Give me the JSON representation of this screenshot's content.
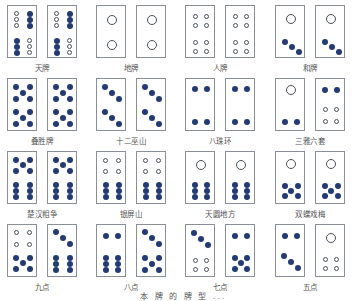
{
  "caption": "本 牌 的 牌 型 ...",
  "colors": {
    "pip_filled": "#243a73",
    "pip_outline": "#4a4f58",
    "border": "#8a8f96"
  },
  "groups": [
    {
      "label": "天牌",
      "x": 7,
      "y": 5,
      "tiles": [
        [
          [
            "o",
            6,
            5
          ],
          [
            "o",
            6,
            11
          ],
          [
            "o",
            6,
            17
          ],
          [
            "f",
            19,
            5
          ],
          [
            "f",
            19,
            11
          ],
          [
            "f",
            19,
            17
          ],
          [
            "f",
            6,
            32
          ],
          [
            "f",
            6,
            38
          ],
          [
            "f",
            6,
            44
          ],
          [
            "o",
            19,
            32
          ],
          [
            "o",
            19,
            38
          ],
          [
            "o",
            19,
            44
          ]
        ],
        [
          [
            "o",
            6,
            5
          ],
          [
            "o",
            6,
            11
          ],
          [
            "o",
            6,
            17
          ],
          [
            "f",
            19,
            5
          ],
          [
            "f",
            19,
            11
          ],
          [
            "f",
            19,
            17
          ],
          [
            "f",
            6,
            32
          ],
          [
            "f",
            6,
            38
          ],
          [
            "f",
            6,
            44
          ],
          [
            "o",
            19,
            32
          ],
          [
            "o",
            19,
            38
          ],
          [
            "o",
            19,
            44
          ]
        ]
      ]
    },
    {
      "label": "地牌",
      "x": 96,
      "y": 5,
      "tiles": [
        [
          [
            "big",
            10,
            9
          ],
          [
            "big",
            10,
            34
          ]
        ],
        [
          [
            "big",
            10,
            9
          ],
          [
            "big",
            10,
            34
          ]
        ]
      ]
    },
    {
      "label": "人牌",
      "x": 185,
      "y": 5,
      "tiles": [
        [
          [
            "o",
            7,
            8
          ],
          [
            "o",
            18,
            8
          ],
          [
            "o",
            7,
            17
          ],
          [
            "o",
            18,
            17
          ],
          [
            "o",
            7,
            34
          ],
          [
            "o",
            18,
            34
          ],
          [
            "o",
            7,
            43
          ],
          [
            "o",
            18,
            43
          ]
        ],
        [
          [
            "o",
            7,
            8
          ],
          [
            "o",
            18,
            8
          ],
          [
            "o",
            7,
            17
          ],
          [
            "o",
            18,
            17
          ],
          [
            "o",
            7,
            34
          ],
          [
            "o",
            18,
            34
          ],
          [
            "o",
            7,
            43
          ],
          [
            "o",
            18,
            43
          ]
        ]
      ]
    },
    {
      "label": "和牌",
      "x": 275,
      "y": 5,
      "tiles": [
        [
          [
            "big",
            10,
            8
          ],
          [
            "f",
            6,
            33
          ],
          [
            "f",
            13,
            38
          ],
          [
            "f",
            20,
            43
          ]
        ],
        [
          [
            "big",
            10,
            8
          ],
          [
            "f",
            6,
            33
          ],
          [
            "f",
            13,
            38
          ],
          [
            "f",
            20,
            43
          ]
        ]
      ]
    },
    {
      "label": "叠胜牌",
      "x": 7,
      "y": 78,
      "tiles": [
        [
          [
            "f",
            5,
            5
          ],
          [
            "f",
            19,
            5
          ],
          [
            "f",
            12,
            11
          ],
          [
            "f",
            5,
            17
          ],
          [
            "f",
            19,
            17
          ],
          [
            "f",
            5,
            30
          ],
          [
            "f",
            19,
            30
          ],
          [
            "f",
            12,
            36
          ],
          [
            "f",
            5,
            42
          ],
          [
            "f",
            19,
            42
          ]
        ],
        [
          [
            "f",
            5,
            5
          ],
          [
            "f",
            19,
            5
          ],
          [
            "f",
            12,
            11
          ],
          [
            "f",
            5,
            17
          ],
          [
            "f",
            19,
            17
          ],
          [
            "f",
            5,
            30
          ],
          [
            "f",
            19,
            30
          ],
          [
            "f",
            12,
            36
          ],
          [
            "f",
            5,
            42
          ],
          [
            "f",
            19,
            42
          ]
        ]
      ]
    },
    {
      "label": "十二巫山",
      "x": 96,
      "y": 78,
      "tiles": [
        [
          [
            "f",
            5,
            5
          ],
          [
            "f",
            12,
            11
          ],
          [
            "f",
            19,
            17
          ],
          [
            "f",
            5,
            30
          ],
          [
            "f",
            12,
            36
          ],
          [
            "f",
            19,
            42
          ]
        ],
        [
          [
            "f",
            5,
            5
          ],
          [
            "f",
            12,
            11
          ],
          [
            "f",
            19,
            17
          ],
          [
            "f",
            5,
            30
          ],
          [
            "f",
            12,
            36
          ],
          [
            "f",
            19,
            42
          ]
        ]
      ]
    },
    {
      "label": "八珠环",
      "x": 185,
      "y": 78,
      "tiles": [
        [
          [
            "f",
            6,
            7
          ],
          [
            "f",
            18,
            7
          ],
          [
            "f",
            6,
            40
          ],
          [
            "f",
            18,
            40
          ]
        ],
        [
          [
            "f",
            6,
            7
          ],
          [
            "f",
            18,
            7
          ],
          [
            "f",
            6,
            40
          ],
          [
            "f",
            18,
            40
          ]
        ]
      ]
    },
    {
      "label": "三雅六套",
      "x": 275,
      "y": 78,
      "tiles": [
        [
          [
            "big",
            10,
            6
          ],
          [
            "f",
            6,
            40
          ],
          [
            "f",
            18,
            40
          ]
        ],
        [
          [
            "f",
            6,
            8
          ],
          [
            "f",
            18,
            8
          ],
          [
            "o",
            7,
            28
          ],
          [
            "o",
            18,
            28
          ],
          [
            "o",
            7,
            40
          ],
          [
            "o",
            18,
            40
          ]
        ]
      ]
    },
    {
      "label": "楚汉相争",
      "x": 7,
      "y": 151,
      "tiles": [
        [
          [
            "f",
            5,
            5
          ],
          [
            "f",
            19,
            5
          ],
          [
            "f",
            12,
            10
          ],
          [
            "f",
            5,
            16
          ],
          [
            "f",
            19,
            16
          ],
          [
            "f",
            5,
            30
          ],
          [
            "f",
            19,
            30
          ],
          [
            "f",
            5,
            36
          ],
          [
            "f",
            19,
            36
          ],
          [
            "f",
            5,
            42
          ],
          [
            "f",
            19,
            42
          ]
        ],
        [
          [
            "f",
            5,
            5
          ],
          [
            "f",
            19,
            5
          ],
          [
            "f",
            12,
            10
          ],
          [
            "f",
            5,
            16
          ],
          [
            "f",
            19,
            16
          ],
          [
            "f",
            5,
            30
          ],
          [
            "f",
            19,
            30
          ],
          [
            "f",
            5,
            36
          ],
          [
            "f",
            19,
            36
          ],
          [
            "f",
            5,
            42
          ],
          [
            "f",
            19,
            42
          ]
        ]
      ]
    },
    {
      "label": "银屏山",
      "x": 96,
      "y": 151,
      "tiles": [
        [
          [
            "o",
            6,
            6
          ],
          [
            "o",
            19,
            6
          ],
          [
            "o",
            6,
            17
          ],
          [
            "o",
            19,
            17
          ],
          [
            "f",
            6,
            30
          ],
          [
            "f",
            19,
            30
          ],
          [
            "f",
            6,
            36
          ],
          [
            "f",
            19,
            36
          ],
          [
            "f",
            6,
            42
          ],
          [
            "f",
            19,
            42
          ]
        ],
        [
          [
            "o",
            6,
            6
          ],
          [
            "o",
            19,
            6
          ],
          [
            "o",
            6,
            17
          ],
          [
            "o",
            19,
            17
          ],
          [
            "f",
            6,
            30
          ],
          [
            "f",
            19,
            30
          ],
          [
            "f",
            6,
            36
          ],
          [
            "f",
            19,
            36
          ],
          [
            "f",
            6,
            42
          ],
          [
            "f",
            19,
            42
          ]
        ]
      ]
    },
    {
      "label": "天圆地方",
      "x": 185,
      "y": 151,
      "tiles": [
        [
          [
            "big",
            10,
            8
          ],
          [
            "f",
            6,
            30
          ],
          [
            "f",
            18,
            30
          ],
          [
            "f",
            6,
            36
          ],
          [
            "f",
            18,
            36
          ],
          [
            "f",
            6,
            42
          ],
          [
            "f",
            18,
            42
          ]
        ],
        [
          [
            "big",
            10,
            8
          ],
          [
            "f",
            6,
            30
          ],
          [
            "f",
            18,
            30
          ],
          [
            "f",
            6,
            36
          ],
          [
            "f",
            18,
            36
          ],
          [
            "f",
            6,
            42
          ],
          [
            "f",
            18,
            42
          ]
        ]
      ]
    },
    {
      "label": "双蝶戏梅",
      "x": 275,
      "y": 151,
      "tiles": [
        [
          [
            "big",
            10,
            7
          ],
          [
            "f",
            6,
            31
          ],
          [
            "f",
            19,
            31
          ],
          [
            "f",
            12,
            36
          ],
          [
            "f",
            6,
            41
          ],
          [
            "f",
            19,
            41
          ]
        ],
        [
          [
            "big",
            10,
            7
          ],
          [
            "f",
            6,
            31
          ],
          [
            "f",
            19,
            31
          ],
          [
            "f",
            12,
            36
          ],
          [
            "f",
            6,
            41
          ],
          [
            "f",
            19,
            41
          ]
        ]
      ]
    },
    {
      "label": "九点",
      "x": 7,
      "y": 224,
      "tiles": [
        [
          [
            "o",
            6,
            5
          ],
          [
            "o",
            19,
            5
          ],
          [
            "o",
            6,
            17
          ],
          [
            "o",
            19,
            17
          ],
          [
            "f",
            5,
            30
          ],
          [
            "f",
            19,
            30
          ],
          [
            "f",
            12,
            35
          ],
          [
            "f",
            5,
            41
          ],
          [
            "f",
            19,
            41
          ]
        ],
        [
          [
            "f",
            5,
            4
          ],
          [
            "f",
            12,
            10
          ],
          [
            "f",
            19,
            16
          ],
          [
            "f",
            5,
            30
          ],
          [
            "f",
            19,
            30
          ],
          [
            "f",
            5,
            36
          ],
          [
            "f",
            19,
            36
          ],
          [
            "f",
            5,
            42
          ],
          [
            "f",
            19,
            42
          ]
        ]
      ]
    },
    {
      "label": "八点",
      "x": 96,
      "y": 224,
      "tiles": [
        [
          [
            "f",
            6,
            8
          ],
          [
            "f",
            18,
            8
          ],
          [
            "f",
            6,
            30
          ],
          [
            "f",
            18,
            30
          ],
          [
            "f",
            6,
            36
          ],
          [
            "f",
            18,
            36
          ],
          [
            "f",
            6,
            42
          ],
          [
            "f",
            18,
            42
          ]
        ],
        [
          [
            "f",
            5,
            4
          ],
          [
            "f",
            12,
            10
          ],
          [
            "f",
            19,
            16
          ],
          [
            "f",
            5,
            30
          ],
          [
            "f",
            19,
            30
          ],
          [
            "f",
            12,
            36
          ],
          [
            "f",
            5,
            42
          ],
          [
            "f",
            19,
            42
          ]
        ]
      ]
    },
    {
      "label": "七点",
      "x": 185,
      "y": 224,
      "tiles": [
        [
          [
            "f",
            5,
            5
          ],
          [
            "f",
            12,
            11
          ],
          [
            "f",
            19,
            17
          ],
          [
            "o",
            7,
            33
          ],
          [
            "o",
            18,
            33
          ],
          [
            "o",
            7,
            42
          ],
          [
            "o",
            18,
            42
          ]
        ],
        [
          [
            "f",
            6,
            8
          ],
          [
            "f",
            18,
            8
          ],
          [
            "f",
            6,
            30
          ],
          [
            "f",
            18,
            30
          ],
          [
            "f",
            12,
            35
          ],
          [
            "f",
            6,
            41
          ],
          [
            "f",
            18,
            41
          ]
        ]
      ]
    },
    {
      "label": "五点",
      "x": 275,
      "y": 224,
      "tiles": [
        [
          [
            "f",
            6,
            8
          ],
          [
            "f",
            18,
            8
          ],
          [
            "f",
            5,
            28
          ],
          [
            "f",
            12,
            34
          ],
          [
            "f",
            19,
            40
          ]
        ],
        [
          [
            "big",
            10,
            8
          ],
          [
            "o",
            7,
            32
          ],
          [
            "o",
            18,
            32
          ],
          [
            "o",
            7,
            41
          ],
          [
            "o",
            18,
            41
          ]
        ]
      ]
    }
  ]
}
